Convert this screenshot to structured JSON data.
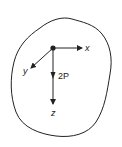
{
  "diagram": {
    "type": "free-body-diagram",
    "axes": [
      {
        "name": "x",
        "label": "x",
        "direction": "right"
      },
      {
        "name": "y",
        "label": "y",
        "direction": "down-left (oblique)"
      },
      {
        "name": "z",
        "label": "z",
        "direction": "down"
      }
    ],
    "force": {
      "label": "2P",
      "direction": "along +z"
    },
    "origin_marker": "filled-dot",
    "boundary": "irregular closed body outline"
  },
  "colors": {
    "stroke": "#222222",
    "background": "#ffffff"
  }
}
